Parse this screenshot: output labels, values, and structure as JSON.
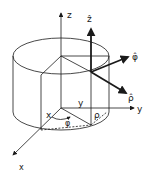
{
  "diagram": {
    "colors": {
      "line": "#1a1a1a",
      "background": "#ffffff"
    },
    "axes": {
      "z": {
        "label": "z"
      },
      "y": {
        "label": "y"
      },
      "x": {
        "label": "x"
      }
    },
    "unit_vectors": {
      "z_hat": {
        "label": "ẑ"
      },
      "phi_hat": {
        "label": "φ̂"
      },
      "rho_hat": {
        "label": "ρ̂"
      }
    },
    "base_labels": {
      "y_component": "y",
      "x_component": "x",
      "rho": "ρ",
      "phi": "φ"
    }
  }
}
